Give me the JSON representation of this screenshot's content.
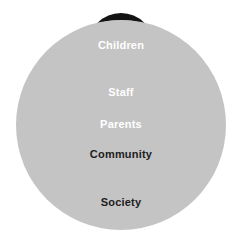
{
  "diagram": {
    "type": "nested-concentric-circles",
    "title": "",
    "background_color": "#ffffff",
    "canvas": {
      "width": 242,
      "height": 251
    },
    "layers": [
      {
        "id": "society",
        "label": "Society",
        "fill": "#c4c4c4",
        "text_color": "#1d1d1d",
        "level": 5,
        "center_x": 121,
        "center_y": 125,
        "radius": 105,
        "label_y": 196,
        "font_size": 11
      },
      {
        "id": "community",
        "label": "Community",
        "fill": "#9b9b9b",
        "text_color": "#1d1d1d",
        "level": 4,
        "center_x": 121,
        "center_y": 100,
        "radius": 80,
        "label_y": 148,
        "font_size": 11
      },
      {
        "id": "parents",
        "label": "Parents",
        "fill": "#595959",
        "text_color": "#ffffff",
        "level": 3,
        "center_x": 121,
        "center_y": 78,
        "radius": 58,
        "label_y": 118,
        "font_size": 11
      },
      {
        "id": "staff",
        "label": "Staff",
        "fill": "#3d3d3d",
        "text_color": "#ffffff",
        "level": 2,
        "center_x": 121,
        "center_y": 60,
        "radius": 40,
        "label_y": 86,
        "font_size": 11
      },
      {
        "id": "children",
        "label": "Children",
        "fill": "#141414",
        "text_color": "#ffffff",
        "level": 1,
        "center_x": 121,
        "center_y": 46,
        "radius": 33,
        "label_y": 39,
        "font_size": 11
      }
    ]
  }
}
